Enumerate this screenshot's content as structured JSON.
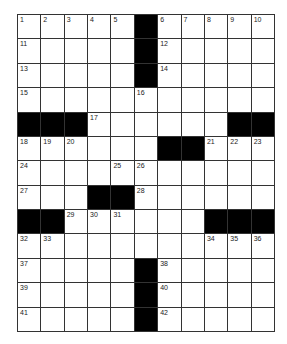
{
  "puzzle": {
    "cols": 11,
    "rows": 13,
    "grid": [
      ".....#.....",
      ".....#.....",
      ".....#.....",
      "...........",
      "###......##",
      "......##...",
      "...........",
      "...##......",
      "##......###",
      "...........",
      ".....#.....",
      ".....#.....",
      ".....#....."
    ],
    "numbers": {
      "0,0": "1",
      "0,1": "2",
      "0,2": "3",
      "0,3": "4",
      "0,4": "5",
      "0,6": "6",
      "0,7": "7",
      "0,8": "8",
      "0,9": "9",
      "0,10": "10",
      "1,0": "11",
      "1,6": "12",
      "2,0": "13",
      "2,6": "14",
      "3,0": "15",
      "3,5": "16",
      "4,3": "17",
      "5,0": "18",
      "5,1": "19",
      "5,2": "20",
      "5,8": "21",
      "5,9": "22",
      "5,10": "23",
      "6,0": "24",
      "6,4": "25",
      "6,5": "26",
      "7,0": "27",
      "7,5": "28",
      "8,2": "29",
      "8,3": "30",
      "8,4": "31",
      "9,0": "32",
      "9,1": "33",
      "9,8": "34",
      "9,9": "35",
      "9,10": "36",
      "10,0": "37",
      "10,6": "38",
      "11,0": "39",
      "11,6": "40",
      "12,0": "41",
      "12,6": "42"
    }
  }
}
